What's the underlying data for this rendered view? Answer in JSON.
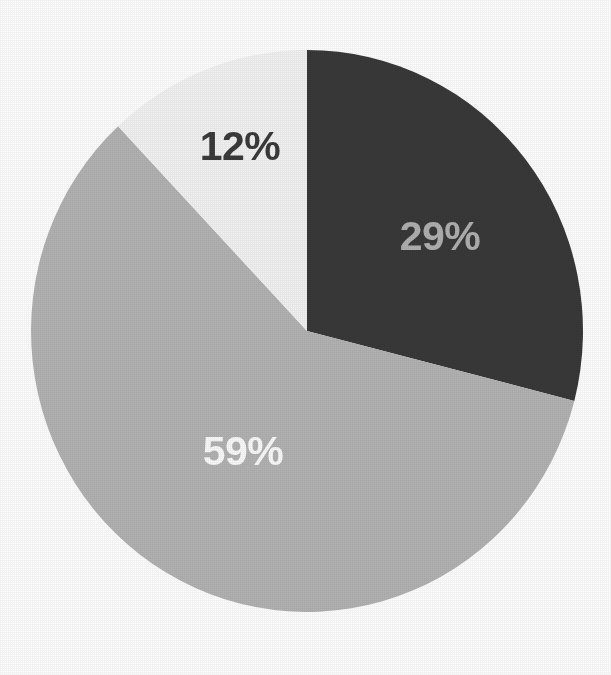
{
  "chart_data": {
    "type": "pie",
    "title": "",
    "subtitle": "",
    "xlabel": "",
    "ylabel": "",
    "legend": "none",
    "grid": false,
    "labels_on_slices": true,
    "start_angle_deg": 0,
    "direction": "clockwise",
    "categories": [
      "Segment 1",
      "Segment 2",
      "Segment 3"
    ],
    "values": [
      29,
      59,
      12
    ],
    "value_labels": [
      "29%",
      "59%",
      "12%"
    ],
    "units": "percent",
    "total": 100,
    "slices": [
      {
        "name": "slice-29",
        "label": "29%",
        "value": 29,
        "color": "#393939",
        "label_color": "#b0b0b0",
        "start_angle_deg": 0,
        "end_angle_deg": 104.4,
        "label_x": 440,
        "label_y": 236
      },
      {
        "name": "slice-59",
        "label": "59%",
        "value": 59,
        "color": "#b3b3b3",
        "label_color": "#fbfbfb",
        "start_angle_deg": 104.4,
        "end_angle_deg": 316.8,
        "label_x": 243,
        "label_y": 451
      },
      {
        "name": "slice-12",
        "label": "12%",
        "value": 12,
        "color": "#f3f3f3",
        "label_color": "#3b3b3b",
        "start_angle_deg": 316.8,
        "end_angle_deg": 360,
        "label_x": 240,
        "label_y": 146
      }
    ],
    "geometry": {
      "center_x": 307,
      "center_y": 331,
      "radius_x": 276,
      "radius_y": 281
    },
    "background_color": "#ffffff"
  }
}
